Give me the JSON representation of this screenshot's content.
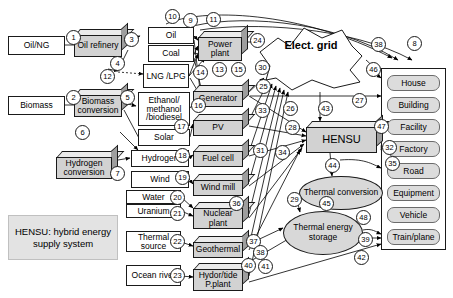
{
  "figure": {
    "legend_text": "HENSU: hybrid energy supply system",
    "grid_label": "Elect. grid",
    "hub_label": "HENSU"
  },
  "primary_sources": [
    {
      "id": "oil-ng",
      "label": "Oil/NG",
      "x": 8,
      "y": 36,
      "w": 57,
      "h": 19
    },
    {
      "id": "biomass",
      "label": "Biomass",
      "x": 8,
      "y": 96,
      "w": 57,
      "h": 19
    },
    {
      "id": "water",
      "label": "Water",
      "x": 126,
      "y": 190,
      "w": 55,
      "h": 14
    },
    {
      "id": "uranium",
      "label": "Uranium",
      "x": 126,
      "y": 204,
      "w": 55,
      "h": 14
    },
    {
      "id": "thermal-source",
      "label": "Thermal source",
      "x": 126,
      "y": 231,
      "w": 55,
      "h": 21
    },
    {
      "id": "ocean-river",
      "label": "Ocean river",
      "x": 126,
      "y": 265,
      "w": 55,
      "h": 21
    }
  ],
  "conversion_blocks": [
    {
      "id": "oil-refinery",
      "label": "Oil refinery",
      "x": 74,
      "y": 29,
      "w": 54,
      "h": 28
    },
    {
      "id": "biomass-conversion",
      "label": "Biomass conversion",
      "x": 74,
      "y": 89,
      "w": 54,
      "h": 28
    },
    {
      "id": "hydrogen-conversion",
      "label": "Hydrogen conversion",
      "x": 56,
      "y": 151,
      "w": 62,
      "h": 28
    }
  ],
  "energy_carriers": [
    {
      "id": "oil",
      "label": "Oil",
      "x": 148,
      "y": 27,
      "w": 46,
      "h": 17
    },
    {
      "id": "coal",
      "label": "Coal",
      "x": 148,
      "y": 45,
      "w": 46,
      "h": 17
    },
    {
      "id": "lng-lpg",
      "label": "LNG /LPG",
      "x": 143,
      "y": 64,
      "w": 46,
      "h": 24
    },
    {
      "id": "ethanol-methanol",
      "label": "Ethanol/ methanol /biodiesel",
      "x": 138,
      "y": 92,
      "w": 52,
      "h": 34
    },
    {
      "id": "solar",
      "label": "Solar",
      "x": 138,
      "y": 129,
      "w": 52,
      "h": 17
    },
    {
      "id": "hydrogen",
      "label": "Hydrogen",
      "x": 131,
      "y": 150,
      "w": 58,
      "h": 17
    },
    {
      "id": "wind",
      "label": "Wind",
      "x": 131,
      "y": 171,
      "w": 58,
      "h": 17
    }
  ],
  "generation_units": [
    {
      "id": "power-plant",
      "label": "Power plant",
      "x": 198,
      "y": 31,
      "w": 50,
      "h": 30
    },
    {
      "id": "generator",
      "label": "Generator",
      "x": 193,
      "y": 85,
      "w": 56,
      "h": 22
    },
    {
      "id": "pv",
      "label": "PV",
      "x": 193,
      "y": 114,
      "w": 56,
      "h": 22
    },
    {
      "id": "fuel-cell",
      "label": "Fuel cell",
      "x": 193,
      "y": 145,
      "w": 56,
      "h": 22
    },
    {
      "id": "wind-mill",
      "label": "Wind mill",
      "x": 193,
      "y": 174,
      "w": 56,
      "h": 22
    },
    {
      "id": "nuclear-plant",
      "label": "Nuclear plant",
      "x": 193,
      "y": 202,
      "w": 56,
      "h": 27
    },
    {
      "id": "geothermal",
      "label": "Geothermal",
      "x": 193,
      "y": 236,
      "w": 56,
      "h": 22
    },
    {
      "id": "hydro-tide",
      "label": "Hydor/tide P.plant",
      "x": 193,
      "y": 263,
      "w": 56,
      "h": 28
    }
  ],
  "storage_nodes": [
    {
      "id": "thermal-conversion",
      "label": "Thermal conversion",
      "x": 299,
      "y": 176,
      "w": 84,
      "h": 34
    },
    {
      "id": "thermal-energy-storage",
      "label": "Thermal energy storage",
      "x": 283,
      "y": 211,
      "w": 80,
      "h": 44
    }
  ],
  "hub": {
    "id": "hensu-hub",
    "label": "HENSU",
    "x": 306,
    "y": 121,
    "w": 77,
    "h": 32
  },
  "grid": {
    "id": "electricity-grid",
    "label": "Elect. grid",
    "x": 256,
    "y": 22,
    "w": 110,
    "h": 70
  },
  "demand_panel": {
    "x": 381,
    "y": 68,
    "w": 65,
    "h": 182,
    "items": [
      {
        "id": "house",
        "label": "House"
      },
      {
        "id": "building",
        "label": "Building"
      },
      {
        "id": "facility",
        "label": "Facility"
      },
      {
        "id": "factory",
        "label": "Factory"
      },
      {
        "id": "road",
        "label": "Road"
      },
      {
        "id": "equipment",
        "label": "Equipment"
      },
      {
        "id": "vehicle",
        "label": "Vehicle"
      },
      {
        "id": "train-plane",
        "label": "Train/plane"
      }
    ]
  },
  "legend_box": {
    "x": 8,
    "y": 215,
    "w": 110,
    "h": 45,
    "text": "HENSU: hybrid energy supply system"
  },
  "flow_numbers": [
    {
      "n": "1",
      "x": 66,
      "y": 30
    },
    {
      "n": "2",
      "x": 66,
      "y": 90
    },
    {
      "n": "3",
      "x": 124,
      "y": 32
    },
    {
      "n": "4",
      "x": 110,
      "y": 56
    },
    {
      "n": "5",
      "x": 120,
      "y": 90
    },
    {
      "n": "6",
      "x": 75,
      "y": 125
    },
    {
      "n": "7",
      "x": 110,
      "y": 166
    },
    {
      "n": "8",
      "x": 407,
      "y": 36
    },
    {
      "n": "9",
      "x": 183,
      "y": 13
    },
    {
      "n": "10",
      "x": 165,
      "y": 9
    },
    {
      "n": "11",
      "x": 206,
      "y": 12
    },
    {
      "n": "12",
      "x": 100,
      "y": 69
    },
    {
      "n": "13",
      "x": 212,
      "y": 62
    },
    {
      "n": "14",
      "x": 193,
      "y": 65
    },
    {
      "n": "15",
      "x": 231,
      "y": 62
    },
    {
      "n": "16",
      "x": 191,
      "y": 98
    },
    {
      "n": "17",
      "x": 174,
      "y": 119
    },
    {
      "n": "18",
      "x": 175,
      "y": 148
    },
    {
      "n": "19",
      "x": 175,
      "y": 170
    },
    {
      "n": "20",
      "x": 170,
      "y": 190
    },
    {
      "n": "21",
      "x": 170,
      "y": 206
    },
    {
      "n": "22",
      "x": 170,
      "y": 234
    },
    {
      "n": "23",
      "x": 170,
      "y": 268
    },
    {
      "n": "24",
      "x": 250,
      "y": 33
    },
    {
      "n": "25",
      "x": 256,
      "y": 79
    },
    {
      "n": "26",
      "x": 283,
      "y": 101
    },
    {
      "n": "27",
      "x": 352,
      "y": 93
    },
    {
      "n": "28",
      "x": 285,
      "y": 120
    },
    {
      "n": "29",
      "x": 287,
      "y": 192
    },
    {
      "n": "30",
      "x": 255,
      "y": 60
    },
    {
      "n": "31",
      "x": 253,
      "y": 143
    },
    {
      "n": "32",
      "x": 382,
      "y": 140
    },
    {
      "n": "33",
      "x": 255,
      "y": 103
    },
    {
      "n": "34",
      "x": 275,
      "y": 145
    },
    {
      "n": "35",
      "x": 385,
      "y": 156
    },
    {
      "n": "36",
      "x": 229,
      "y": 196
    },
    {
      "n": "37",
      "x": 246,
      "y": 234
    },
    {
      "n": "38",
      "x": 253,
      "y": 245
    },
    {
      "n": "38",
      "x": 371,
      "y": 37
    },
    {
      "n": "39",
      "x": 358,
      "y": 232
    },
    {
      "n": "40",
      "x": 241,
      "y": 258
    },
    {
      "n": "41",
      "x": 258,
      "y": 259
    },
    {
      "n": "42",
      "x": 354,
      "y": 250
    },
    {
      "n": "43",
      "x": 318,
      "y": 101
    },
    {
      "n": "44",
      "x": 325,
      "y": 158
    },
    {
      "n": "45",
      "x": 319,
      "y": 196
    },
    {
      "n": "46",
      "x": 366,
      "y": 62
    },
    {
      "n": "47",
      "x": 374,
      "y": 119
    },
    {
      "n": "48",
      "x": 356,
      "y": 210
    }
  ]
}
